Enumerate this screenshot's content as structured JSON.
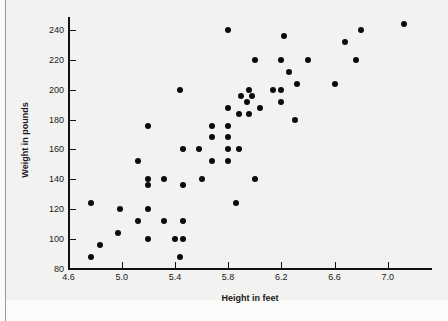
{
  "chart_data": {
    "type": "scatter",
    "title": "",
    "xlabel": "Height in feet",
    "ylabel": "Weight in pounds",
    "xlim": [
      4.6,
      7.25
    ],
    "ylim": [
      80,
      250
    ],
    "xticks": [
      4.6,
      5.0,
      5.4,
      5.8,
      6.2,
      6.6,
      7.0
    ],
    "xtick_labels": [
      "4.6",
      "5.0",
      "5.4",
      "5.8",
      "6.2",
      "6.6",
      "7.0"
    ],
    "yticks": [
      80,
      100,
      120,
      140,
      160,
      180,
      200,
      220,
      240
    ],
    "ytick_labels": [
      "80",
      "100",
      "120",
      "140",
      "160",
      "180",
      "200",
      "220",
      "240"
    ],
    "grid": false,
    "legend": null,
    "marker": "filled-circle",
    "marker_color": "#0b0b0b",
    "points": [
      {
        "x": 4.77,
        "y": 88
      },
      {
        "x": 4.84,
        "y": 96
      },
      {
        "x": 4.77,
        "y": 124
      },
      {
        "x": 4.97,
        "y": 104
      },
      {
        "x": 4.99,
        "y": 120
      },
      {
        "x": 5.12,
        "y": 112
      },
      {
        "x": 5.12,
        "y": 152
      },
      {
        "x": 5.2,
        "y": 100
      },
      {
        "x": 5.2,
        "y": 120
      },
      {
        "x": 5.2,
        "y": 136
      },
      {
        "x": 5.2,
        "y": 140
      },
      {
        "x": 5.2,
        "y": 176
      },
      {
        "x": 5.32,
        "y": 112
      },
      {
        "x": 5.32,
        "y": 140
      },
      {
        "x": 5.4,
        "y": 100
      },
      {
        "x": 5.44,
        "y": 88
      },
      {
        "x": 5.44,
        "y": 200
      },
      {
        "x": 5.46,
        "y": 100
      },
      {
        "x": 5.46,
        "y": 112
      },
      {
        "x": 5.46,
        "y": 136
      },
      {
        "x": 5.46,
        "y": 160
      },
      {
        "x": 5.58,
        "y": 160
      },
      {
        "x": 5.6,
        "y": 140
      },
      {
        "x": 5.68,
        "y": 152
      },
      {
        "x": 5.68,
        "y": 168
      },
      {
        "x": 5.68,
        "y": 176
      },
      {
        "x": 5.8,
        "y": 152
      },
      {
        "x": 5.8,
        "y": 160
      },
      {
        "x": 5.8,
        "y": 168
      },
      {
        "x": 5.8,
        "y": 176
      },
      {
        "x": 5.8,
        "y": 188
      },
      {
        "x": 5.8,
        "y": 240
      },
      {
        "x": 5.86,
        "y": 124
      },
      {
        "x": 5.88,
        "y": 160
      },
      {
        "x": 5.88,
        "y": 184
      },
      {
        "x": 5.9,
        "y": 196
      },
      {
        "x": 5.94,
        "y": 192
      },
      {
        "x": 5.96,
        "y": 200
      },
      {
        "x": 5.96,
        "y": 184
      },
      {
        "x": 5.98,
        "y": 196
      },
      {
        "x": 6.0,
        "y": 140
      },
      {
        "x": 6.0,
        "y": 220
      },
      {
        "x": 6.04,
        "y": 188
      },
      {
        "x": 6.14,
        "y": 200
      },
      {
        "x": 6.2,
        "y": 192
      },
      {
        "x": 6.2,
        "y": 200
      },
      {
        "x": 6.2,
        "y": 220
      },
      {
        "x": 6.22,
        "y": 236
      },
      {
        "x": 6.26,
        "y": 212
      },
      {
        "x": 6.3,
        "y": 180
      },
      {
        "x": 6.32,
        "y": 204
      },
      {
        "x": 6.4,
        "y": 220
      },
      {
        "x": 6.6,
        "y": 204
      },
      {
        "x": 6.68,
        "y": 232
      },
      {
        "x": 6.76,
        "y": 220
      },
      {
        "x": 6.8,
        "y": 240
      },
      {
        "x": 7.12,
        "y": 244
      }
    ]
  }
}
